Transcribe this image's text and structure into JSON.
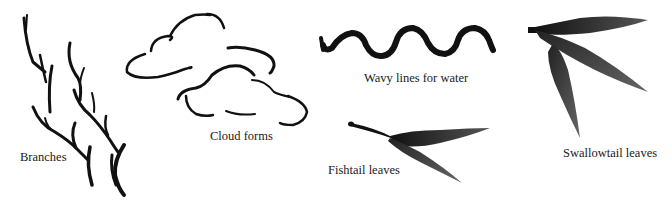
{
  "figure": {
    "type": "brush-stroke-examples",
    "ink_color": "#111111",
    "background": "#ffffff",
    "items": [
      {
        "id": "branches",
        "label": "Branches"
      },
      {
        "id": "cloud-forms",
        "label": "Cloud forms"
      },
      {
        "id": "wavy-lines",
        "label": "Wavy lines for water"
      },
      {
        "id": "fishtail-leaves",
        "label": "Fishtail leaves"
      },
      {
        "id": "swallowtail-leaves",
        "label": "Swallowtail leaves"
      }
    ]
  }
}
